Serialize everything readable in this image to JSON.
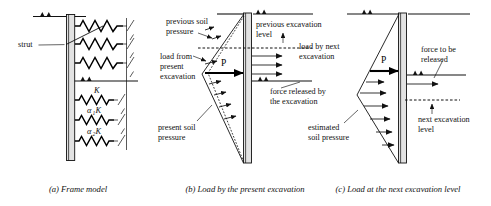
{
  "figure": {
    "width": 491,
    "height": 206,
    "background": "#ffffff",
    "line_color": "#111111",
    "wall_fill": "#e2e2e2"
  },
  "panels": [
    {
      "id": "a",
      "caption": "(a) Frame model",
      "labels": {
        "strut": "strut",
        "spring_k": "K",
        "spring_a1k_alpha": "α",
        "spring_a1k_sub": "1",
        "spring_a1k_k": "K",
        "spring_a2k_alpha": "α",
        "spring_a2k_sub": "2",
        "spring_a2k_k": "K"
      }
    },
    {
      "id": "b",
      "caption": "(b) Load by the present excavation",
      "labels": {
        "previous_soil_pressure_l1": "previous soil",
        "previous_soil_pressure_l2": "pressure",
        "load_from_present_excavation_l1": "load from",
        "load_from_present_excavation_l2": "present",
        "load_from_present_excavation_l3": "excavation",
        "present_soil_pressure_l1": "present soil",
        "present_soil_pressure_l2": "pressure",
        "previous_excavation_level_l1": "previous excavation",
        "previous_excavation_level_l2": "level",
        "load_by_next_excavation_l1": "load by next",
        "load_by_next_excavation_l2": "excavation",
        "force_released_l1": "force released by",
        "force_released_l2": "the excavation",
        "resultant_force": "P"
      }
    },
    {
      "id": "c",
      "caption": "(c) Load at the next excavation level",
      "labels": {
        "estimated_soil_pressure_l1": "estimated",
        "estimated_soil_pressure_l2": "soil pressure",
        "force_to_be_released_l1": "force to be",
        "force_to_be_released_l2": "released",
        "next_excavation_level_l1": "next excavation",
        "next_excavation_level_l2": "level",
        "resultant_force": "P"
      }
    }
  ]
}
